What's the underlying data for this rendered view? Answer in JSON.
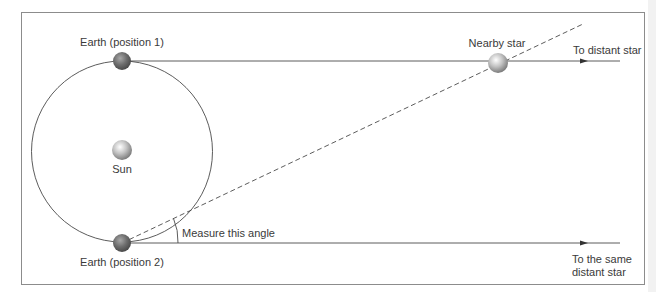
{
  "diagram": {
    "labels": {
      "earth_position_1": "Earth (position 1)",
      "earth_position_2": "Earth (position 2)",
      "sun": "Sun",
      "nearby_star": "Nearby star",
      "to_distant_star": "To distant star",
      "to_same_distant_star_line1": "To the same",
      "to_same_distant_star_line2": "distant star",
      "measure_angle": "Measure this angle"
    },
    "colors": {
      "frame": "#8c8c8c",
      "line": "#4a4a4a",
      "earth": "#6e6e6e",
      "sun": "#c8c8c8",
      "text": "#3a3a3a"
    }
  }
}
